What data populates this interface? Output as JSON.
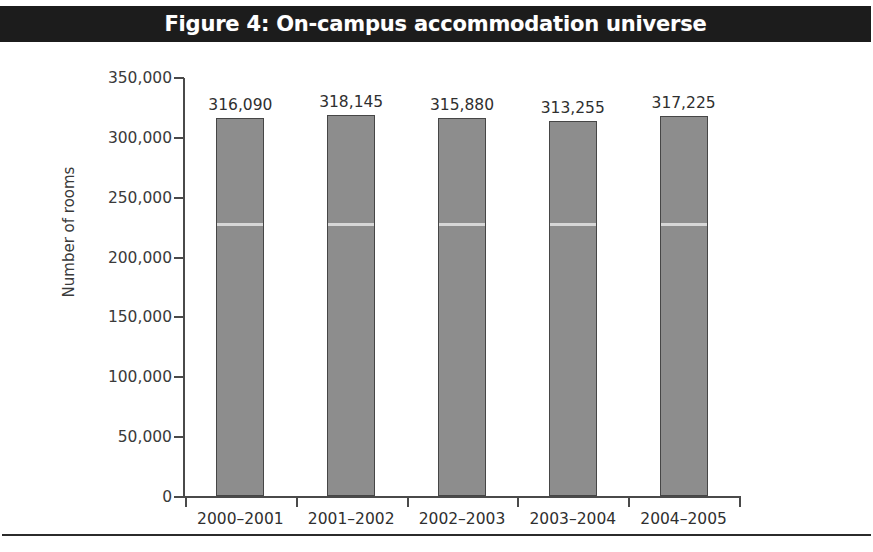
{
  "figure": {
    "title": "Figure 4: On-campus accommodation universe",
    "banner_color": "#1c1c1c",
    "banner_text_color": "#ffffff",
    "bottom_rule_color": "#2b2b2b"
  },
  "chart_data": {
    "type": "bar",
    "title": "Figure 4: On-campus accommodation universe",
    "subtitle": "",
    "xlabel": "",
    "ylabel": "Number of rooms",
    "categories": [
      "2000–2001",
      "2001–2002",
      "2002–2003",
      "2003–2004",
      "2004–2005"
    ],
    "values": [
      316090,
      318145,
      315880,
      313255,
      317225
    ],
    "value_labels": [
      "316,090",
      "318,145",
      "315,880",
      "313,255",
      "317,225"
    ],
    "ylim": [
      0,
      350000
    ],
    "yticks": [
      0,
      50000,
      100000,
      150000,
      200000,
      250000,
      300000,
      350000
    ],
    "ytick_labels": [
      "0",
      "50,000",
      "100,000",
      "150,000",
      "200,000",
      "250,000",
      "300,000",
      "350,000"
    ],
    "grid": false,
    "legend": false,
    "legend_position": "none",
    "bar_fill_color": "#8d8d8d",
    "bar_edge_color": "#464646",
    "axis_color": "#4a4a4a",
    "text_color": "#2f2f2f",
    "data_labels_shown": true,
    "annotations": []
  }
}
